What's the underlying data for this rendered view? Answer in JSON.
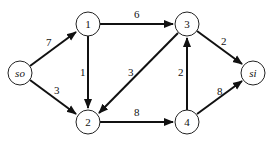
{
  "diagram": {
    "type": "directed-flow-network",
    "nodes": [
      {
        "id": "so",
        "label": "so",
        "italic": true
      },
      {
        "id": "1",
        "label": "1"
      },
      {
        "id": "2",
        "label": "2"
      },
      {
        "id": "3",
        "label": "3"
      },
      {
        "id": "4",
        "label": "4"
      },
      {
        "id": "si",
        "label": "si",
        "italic": true
      }
    ],
    "edges": [
      {
        "from": "so",
        "to": "1",
        "weight": "7"
      },
      {
        "from": "so",
        "to": "2",
        "weight": "3"
      },
      {
        "from": "1",
        "to": "3",
        "weight": "6"
      },
      {
        "from": "1",
        "to": "2",
        "weight": "1"
      },
      {
        "from": "3",
        "to": "2",
        "weight": "3"
      },
      {
        "from": "2",
        "to": "4",
        "weight": "8"
      },
      {
        "from": "4",
        "to": "3",
        "weight": "2"
      },
      {
        "from": "3",
        "to": "si",
        "weight": "2"
      },
      {
        "from": "4",
        "to": "si",
        "weight": "8"
      }
    ]
  }
}
